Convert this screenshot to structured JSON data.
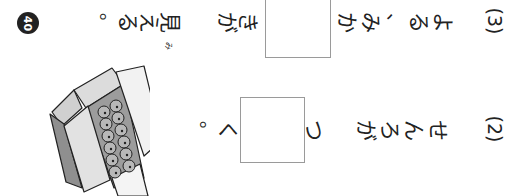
{
  "page_number": "40",
  "orientation": "page rotated 90° clockwise (vertical Japanese text reads right-to-left)",
  "items": [
    {
      "number": "(3)",
      "before_box": "よる、みか",
      "after_box": "きが見える。",
      "ruby": {
        "base": "見",
        "reading": "み"
      }
    },
    {
      "number": "(2)",
      "before_box": "せんろが つ",
      "after_box": "く。"
    }
  ],
  "illustration": "cardboard-box-of-mandarin-oranges",
  "colors": {
    "text": "#222222",
    "box_border": "#9a9a9a",
    "box_shade": "#8f8f8f",
    "box_light": "#d6d6d6",
    "badge": "#222222"
  }
}
